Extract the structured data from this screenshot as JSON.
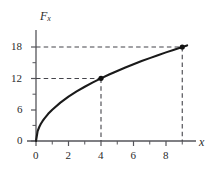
{
  "chart_data": {
    "type": "line",
    "title": "",
    "xlabel": "x",
    "ylabel": "F_x",
    "ylabel_base": "F",
    "ylabel_sub": "x",
    "function": "F_x = 6*sqrt(x)",
    "x": [
      0,
      0.1,
      0.2,
      0.3,
      0.4,
      0.5,
      0.75,
      1,
      1.5,
      2,
      2.5,
      3,
      3.5,
      4,
      4.5,
      5,
      5.5,
      6,
      6.5,
      7,
      7.5,
      8,
      8.5,
      9,
      9.3
    ],
    "y": [
      0,
      1.9,
      2.68,
      3.29,
      3.79,
      4.24,
      5.2,
      6,
      7.35,
      8.49,
      9.49,
      10.39,
      11.22,
      12,
      12.73,
      13.42,
      14.07,
      14.7,
      15.3,
      15.87,
      16.43,
      16.97,
      17.49,
      18,
      18.3
    ],
    "xlim": [
      0,
      9.8
    ],
    "ylim": [
      0,
      19.5
    ],
    "grid": false,
    "legend": null,
    "x_ticks_major": [
      0,
      2,
      4,
      6,
      8
    ],
    "x_tick_labels": [
      "0",
      "2",
      "4",
      "6",
      "8"
    ],
    "x_ticks_minor": [
      1,
      3,
      5,
      7,
      9
    ],
    "y_ticks_major": [
      0,
      6,
      12,
      18
    ],
    "y_tick_labels": [
      "0",
      "6",
      "12",
      "18"
    ],
    "y_ticks_minor": [
      3,
      9,
      15
    ],
    "annotations": {
      "points": [
        {
          "x": 4,
          "y": 12,
          "marker": "filled-circle"
        },
        {
          "x": 9,
          "y": 18,
          "marker": "filled-circle"
        }
      ],
      "guide_lines": [
        {
          "from": [
            0,
            12
          ],
          "to": [
            4,
            12
          ],
          "style": "dashed",
          "orientation": "horizontal"
        },
        {
          "from": [
            4,
            0
          ],
          "to": [
            4,
            12
          ],
          "style": "dashed",
          "orientation": "vertical"
        },
        {
          "from": [
            0,
            18
          ],
          "to": [
            9,
            18
          ],
          "style": "dashed",
          "orientation": "horizontal"
        },
        {
          "from": [
            9,
            0
          ],
          "to": [
            9,
            18
          ],
          "style": "dashed",
          "orientation": "vertical"
        }
      ]
    },
    "colors": {
      "background": "#ffffff",
      "curve": "#1a1a1a",
      "axis": "#55555a",
      "dashed": "#44444a",
      "text": "#2b2b2b",
      "marker": "#111111"
    }
  }
}
